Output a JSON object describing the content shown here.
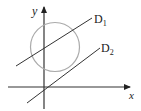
{
  "diagram": {
    "axes": {
      "x_label": "x",
      "y_label": "y"
    },
    "lines": [
      {
        "name": "D",
        "subscript": "1"
      },
      {
        "name": "D",
        "subscript": "2"
      }
    ],
    "colors": {
      "axis": "#333333",
      "line": "#333333",
      "circle": "#aaaaaa"
    }
  }
}
